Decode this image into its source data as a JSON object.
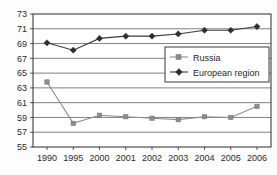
{
  "chart_data": {
    "type": "line",
    "title": "",
    "subtitle": "",
    "xlabel": "",
    "ylabel": "",
    "categories": [
      "1990",
      "1995",
      "2000",
      "2001",
      "2002",
      "2003",
      "2004",
      "2005",
      "2006"
    ],
    "series": [
      {
        "name": "Russia",
        "marker": "square",
        "color": "#8d8d8d",
        "values": [
          63.8,
          58.2,
          59.3,
          59.1,
          58.9,
          58.7,
          59.1,
          59.0,
          60.5
        ]
      },
      {
        "name": "European region",
        "marker": "diamond",
        "color": "#2e2e2e",
        "values": [
          69.1,
          68.1,
          69.7,
          70.0,
          70.0,
          70.3,
          70.8,
          70.8,
          71.3
        ]
      }
    ],
    "ylim": [
      55,
      73
    ],
    "ytick_step": 2,
    "ytick_labels": [
      "73",
      "71",
      "69",
      "67",
      "65",
      "63",
      "61",
      "59",
      "57",
      "55"
    ],
    "ytick_values": [
      73,
      71,
      69,
      67,
      65,
      63,
      61,
      59,
      57,
      55
    ],
    "grid": true,
    "grid_orientation": "horizontal",
    "legend_position": "center-right",
    "legend": [
      "Russia",
      "European region"
    ]
  },
  "legend": {
    "items": [
      {
        "label": "Russia",
        "marker": "square-marker-icon"
      },
      {
        "label": "European region",
        "marker": "diamond-marker-icon"
      }
    ]
  }
}
